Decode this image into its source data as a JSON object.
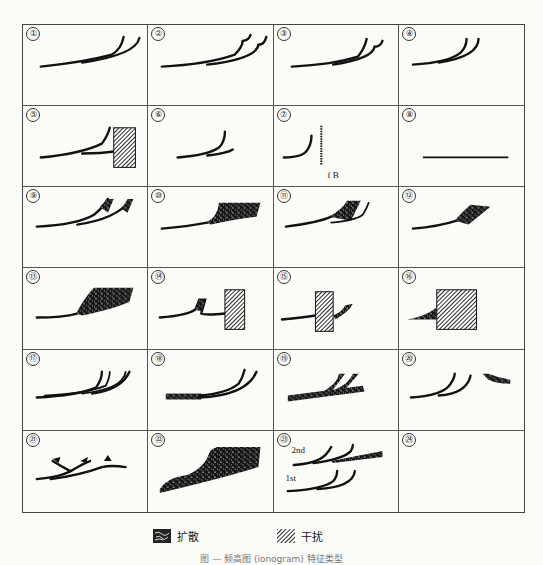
{
  "figure": {
    "panels": [
      {
        "num": "①",
        "kind": "two-branch"
      },
      {
        "num": "②",
        "kind": "two-branch-hooked"
      },
      {
        "num": "③",
        "kind": "two-branch-hooked-right"
      },
      {
        "num": "④",
        "kind": "two-branch-short"
      },
      {
        "num": "⑤",
        "kind": "branch-with-interference"
      },
      {
        "num": "⑥",
        "kind": "single-short-branch"
      },
      {
        "num": "⑦",
        "kind": "branch-with-fB-line",
        "label": "f B"
      },
      {
        "num": "⑧",
        "kind": "flat-line"
      },
      {
        "num": "⑨",
        "kind": "two-branch-diffuse-tips"
      },
      {
        "num": "⑩",
        "kind": "diffuse-band"
      },
      {
        "num": "⑪",
        "kind": "diffuse-wedge"
      },
      {
        "num": "⑫",
        "kind": "diffuse-wedge-small"
      },
      {
        "num": "⑬",
        "kind": "large-diffuse-area"
      },
      {
        "num": "⑭",
        "kind": "diffuse-with-interference"
      },
      {
        "num": "⑮",
        "kind": "interference-crossing"
      },
      {
        "num": "⑯",
        "kind": "large-interference-block"
      },
      {
        "num": "⑰",
        "kind": "multiple-branches"
      },
      {
        "num": "⑱",
        "kind": "diffuse-baseline-branches"
      },
      {
        "num": "⑲",
        "kind": "diffuse-thick-baseline"
      },
      {
        "num": "⑳",
        "kind": "branches-with-detached-diffuse"
      },
      {
        "num": "㉑",
        "kind": "forked-tips"
      },
      {
        "num": "㉒",
        "kind": "huge-diffuse-area"
      },
      {
        "num": "㉓",
        "kind": "first-second-order",
        "label_2nd": "2nd",
        "label_1st": "1st"
      },
      {
        "num": "㉔",
        "kind": "empty"
      }
    ]
  },
  "legend": {
    "diffuse_label": "扩散",
    "interference_label": "干扰"
  },
  "caption": "图 — 频高图 (ionogram) 特征类型"
}
